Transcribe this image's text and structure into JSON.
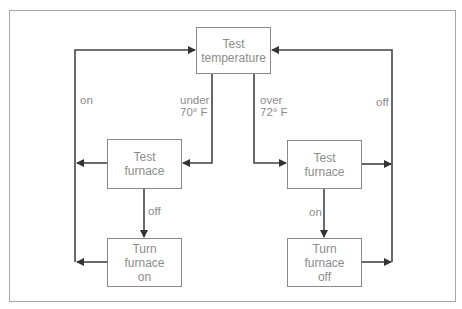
{
  "diagram": {
    "type": "flowchart",
    "nodes": {
      "test_temperature": {
        "line1": "Test",
        "line2": "temperature"
      },
      "left_test_furnace": {
        "line1": "Test",
        "line2": "furnace"
      },
      "left_turn_furnace": {
        "line1": "Turn",
        "line2": "furnace",
        "line3": "on"
      },
      "right_test_furnace": {
        "line1": "Test",
        "line2": "furnace"
      },
      "right_turn_furnace": {
        "line1": "Turn",
        "line2": "furnace",
        "line3": "off"
      }
    },
    "edge_labels": {
      "left_loop": "on",
      "under_line1": "under",
      "under_line2": "70° F",
      "over_line1": "over",
      "over_line2": "72° F",
      "right_loop": "off",
      "left_down": "off",
      "right_down": "on"
    },
    "colors": {
      "line": "#444444",
      "box_border": "#8a8a8a",
      "text": "#8c8c8c",
      "frame": "#a8a8a8"
    }
  }
}
